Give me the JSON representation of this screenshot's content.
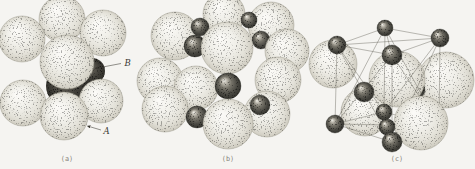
{
  "figure": {
    "name": "crystal-structure-illustration",
    "colors": {
      "background": "#f5f4f1",
      "line": "#67645c",
      "label_ink": "#3a3832",
      "caption_ink": "#85827a",
      "sphere_tint": "#efeee8",
      "ion_dark": "#45443e"
    },
    "panels": [
      {
        "id": "a",
        "caption": "(a)",
        "caption_pos": {
          "x": 67,
          "y": 161
        },
        "labels": [
          {
            "text": "B",
            "x": 124.5,
            "y": 66,
            "arrow": {
              "x1": 121,
              "y1": 63.5,
              "x2": 95,
              "y2": 68.5
            }
          },
          {
            "text": "A",
            "x": 103.5,
            "y": 134,
            "arrow": {
              "x1": 101,
              "y1": 130,
              "x2": 87.5,
              "y2": 126
            }
          }
        ],
        "layers": [
          {
            "type": "spheres",
            "items": [
              {
                "t": "L",
                "x": 62,
                "y": 19,
                "r": 23
              },
              {
                "t": "L",
                "x": 22,
                "y": 39,
                "r": 23
              },
              {
                "t": "L",
                "x": 103,
                "y": 33,
                "r": 23
              },
              {
                "t": "D",
                "x": 67,
                "y": 86,
                "r": 21
              },
              {
                "t": "D",
                "x": 92,
                "y": 71,
                "r": 13
              },
              {
                "t": "L",
                "x": 67,
                "y": 62,
                "r": 27
              },
              {
                "t": "L",
                "x": 23,
                "y": 103,
                "r": 23
              },
              {
                "t": "L",
                "x": 101,
                "y": 101,
                "r": 22
              },
              {
                "t": "L",
                "x": 64,
                "y": 116,
                "r": 24
              }
            ]
          }
        ]
      },
      {
        "id": "b",
        "caption": "(b)",
        "caption_pos": {
          "x": 228,
          "y": 161
        },
        "labels": [],
        "layers": [
          {
            "type": "spheres",
            "items": [
              {
                "t": "L",
                "x": 175,
                "y": 36,
                "r": 24
              },
              {
                "t": "L",
                "x": 224,
                "y": 14,
                "r": 21
              },
              {
                "t": "L",
                "x": 271,
                "y": 25,
                "r": 23
              },
              {
                "t": "S",
                "x": 200,
                "y": 27,
                "r": 9
              },
              {
                "t": "S",
                "x": 249,
                "y": 20,
                "r": 8
              },
              {
                "t": "S",
                "x": 195,
                "y": 46,
                "r": 11
              },
              {
                "t": "S",
                "x": 261,
                "y": 40,
                "r": 9
              },
              {
                "t": "L",
                "x": 287,
                "y": 51,
                "r": 22
              },
              {
                "t": "L",
                "x": 227,
                "y": 48,
                "r": 26
              },
              {
                "t": "L",
                "x": 160,
                "y": 81,
                "r": 23
              },
              {
                "t": "L",
                "x": 278,
                "y": 80,
                "r": 23
              },
              {
                "t": "L",
                "x": 196,
                "y": 88,
                "r": 22
              },
              {
                "t": "S",
                "x": 228,
                "y": 86,
                "r": 13
              },
              {
                "t": "L",
                "x": 165,
                "y": 109,
                "r": 23
              },
              {
                "t": "S",
                "x": 197,
                "y": 117,
                "r": 11
              },
              {
                "t": "L",
                "x": 267,
                "y": 114,
                "r": 23
              },
              {
                "t": "S",
                "x": 260,
                "y": 105,
                "r": 10
              },
              {
                "t": "L",
                "x": 228,
                "y": 124,
                "r": 25
              }
            ]
          }
        ]
      },
      {
        "id": "c",
        "caption": "(c)",
        "caption_pos": {
          "x": 397,
          "y": 161
        },
        "labels": [],
        "layers": [
          {
            "type": "spheres",
            "items": [
              {
                "t": "L",
                "x": 365,
                "y": 112,
                "r": 24
              },
              {
                "t": "L",
                "x": 446,
                "y": 80,
                "r": 28
              },
              {
                "t": "S",
                "x": 416,
                "y": 90,
                "r": 9
              },
              {
                "t": "L",
                "x": 333,
                "y": 64,
                "r": 24
              },
              {
                "t": "L",
                "x": 397,
                "y": 79,
                "r": 28
              }
            ]
          },
          {
            "type": "lines",
            "items": [
              [
                335,
                124,
                392,
                142
              ],
              [
                392,
                142,
                439,
                126
              ],
              [
                439,
                126,
                384,
                112
              ],
              [
                384,
                112,
                335,
                124
              ],
              [
                337,
                45,
                392,
                55
              ],
              [
                392,
                55,
                440,
                38
              ],
              [
                440,
                38,
                385,
                28
              ],
              [
                385,
                28,
                337,
                45
              ],
              [
                335,
                124,
                337,
                45
              ],
              [
                392,
                142,
                392,
                55
              ],
              [
                384,
                112,
                385,
                28
              ],
              [
                439,
                126,
                440,
                38
              ],
              [
                335,
                124,
                392,
                55
              ],
              [
                392,
                142,
                337,
                45
              ],
              [
                337,
                45,
                440,
                38
              ],
              [
                392,
                55,
                385,
                28
              ],
              [
                392,
                142,
                440,
                38
              ],
              [
                439,
                126,
                392,
                55
              ],
              [
                335,
                124,
                385,
                28
              ],
              [
                384,
                112,
                337,
                45
              ],
              [
                384,
                112,
                440,
                38
              ],
              [
                439,
                126,
                385,
                28
              ],
              [
                335,
                124,
                439,
                126
              ],
              [
                392,
                142,
                384,
                112
              ]
            ]
          },
          {
            "type": "spheres",
            "items": [
              {
                "t": "L",
                "x": 421,
                "y": 123,
                "r": 27
              },
              {
                "t": "S",
                "x": 337,
                "y": 45,
                "r": 9
              },
              {
                "t": "S",
                "x": 385,
                "y": 28,
                "r": 8
              },
              {
                "t": "S",
                "x": 440,
                "y": 38,
                "r": 9
              },
              {
                "t": "S",
                "x": 392,
                "y": 55,
                "r": 10
              },
              {
                "t": "S",
                "x": 364,
                "y": 92,
                "r": 10
              },
              {
                "t": "S",
                "x": 335,
                "y": 124,
                "r": 9
              },
              {
                "t": "S",
                "x": 384,
                "y": 112,
                "r": 8
              },
              {
                "t": "S",
                "x": 387,
                "y": 127,
                "r": 8
              },
              {
                "t": "S",
                "x": 392,
                "y": 142,
                "r": 10
              }
            ]
          }
        ]
      }
    ]
  }
}
